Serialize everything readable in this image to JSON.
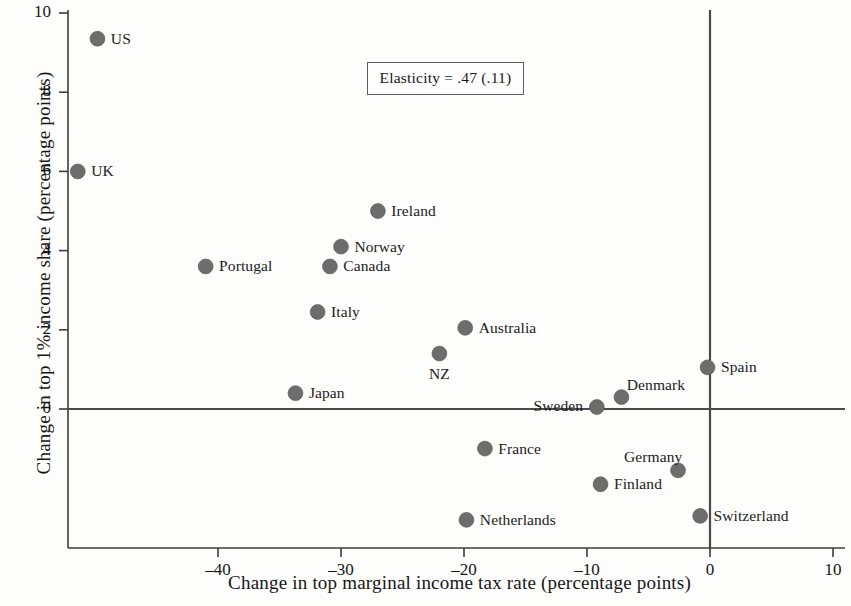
{
  "chart_data": {
    "type": "scatter",
    "title": "",
    "xlabel": "Change in top marginal income tax rate (percentage points)",
    "ylabel": "Change in top 1% income share (percentage points)",
    "xlim": [
      -52.8,
      11.5
    ],
    "ylim": [
      -3.3,
      10.35
    ],
    "xticks": [
      -40,
      -30,
      -20,
      -10,
      0,
      10
    ],
    "xtick_labels": [
      "–40",
      "–30",
      "–20",
      "–10",
      "0",
      "10"
    ],
    "yticks": [
      0,
      2,
      4,
      6,
      8,
      10
    ],
    "ytick_labels": [
      "0",
      "2",
      "4",
      "6",
      "8",
      "10"
    ],
    "grid": false,
    "legend": null,
    "marker_color": "#6d6d6d",
    "axis_color": "#3d3d3d",
    "reference_lines": [
      {
        "type": "horizontal",
        "value": 0
      },
      {
        "type": "vertical",
        "value": 0
      }
    ],
    "annotations": [
      {
        "text": "Elasticity = .47 (.11)",
        "x": -21.5,
        "y": 8.35,
        "boxed": true
      }
    ],
    "points": [
      {
        "label": "US",
        "x": -49.8,
        "y": 9.35,
        "label_pos": "right"
      },
      {
        "label": "UK",
        "x": -51.4,
        "y": 6.0,
        "label_pos": "right"
      },
      {
        "label": "Ireland",
        "x": -27.0,
        "y": 5.0,
        "label_pos": "right"
      },
      {
        "label": "Norway",
        "x": -30.0,
        "y": 4.1,
        "label_pos": "right"
      },
      {
        "label": "Canada",
        "x": -30.9,
        "y": 3.6,
        "label_pos": "right"
      },
      {
        "label": "Portugal",
        "x": -41.0,
        "y": 3.6,
        "label_pos": "right"
      },
      {
        "label": "Italy",
        "x": -31.9,
        "y": 2.45,
        "label_pos": "right"
      },
      {
        "label": "Australia",
        "x": -19.9,
        "y": 2.05,
        "label_pos": "right"
      },
      {
        "label": "NZ",
        "x": -22.0,
        "y": 1.4,
        "label_pos": "below"
      },
      {
        "label": "Spain",
        "x": -0.2,
        "y": 1.05,
        "label_pos": "right"
      },
      {
        "label": "Japan",
        "x": -33.7,
        "y": 0.4,
        "label_pos": "right"
      },
      {
        "label": "Denmark",
        "x": -7.2,
        "y": 0.3,
        "label_pos": "above-right"
      },
      {
        "label": "Sweden",
        "x": -9.2,
        "y": 0.05,
        "label_pos": "left"
      },
      {
        "label": "France",
        "x": -18.3,
        "y": -1.0,
        "label_pos": "right"
      },
      {
        "label": "Germany",
        "x": -2.6,
        "y": -1.55,
        "label_pos": "above-left"
      },
      {
        "label": "Finland",
        "x": -8.9,
        "y": -1.9,
        "label_pos": "right"
      },
      {
        "label": "Netherlands",
        "x": -19.8,
        "y": -2.8,
        "label_pos": "right"
      },
      {
        "label": "Switzerland",
        "x": -0.8,
        "y": -2.7,
        "label_pos": "right"
      }
    ]
  }
}
